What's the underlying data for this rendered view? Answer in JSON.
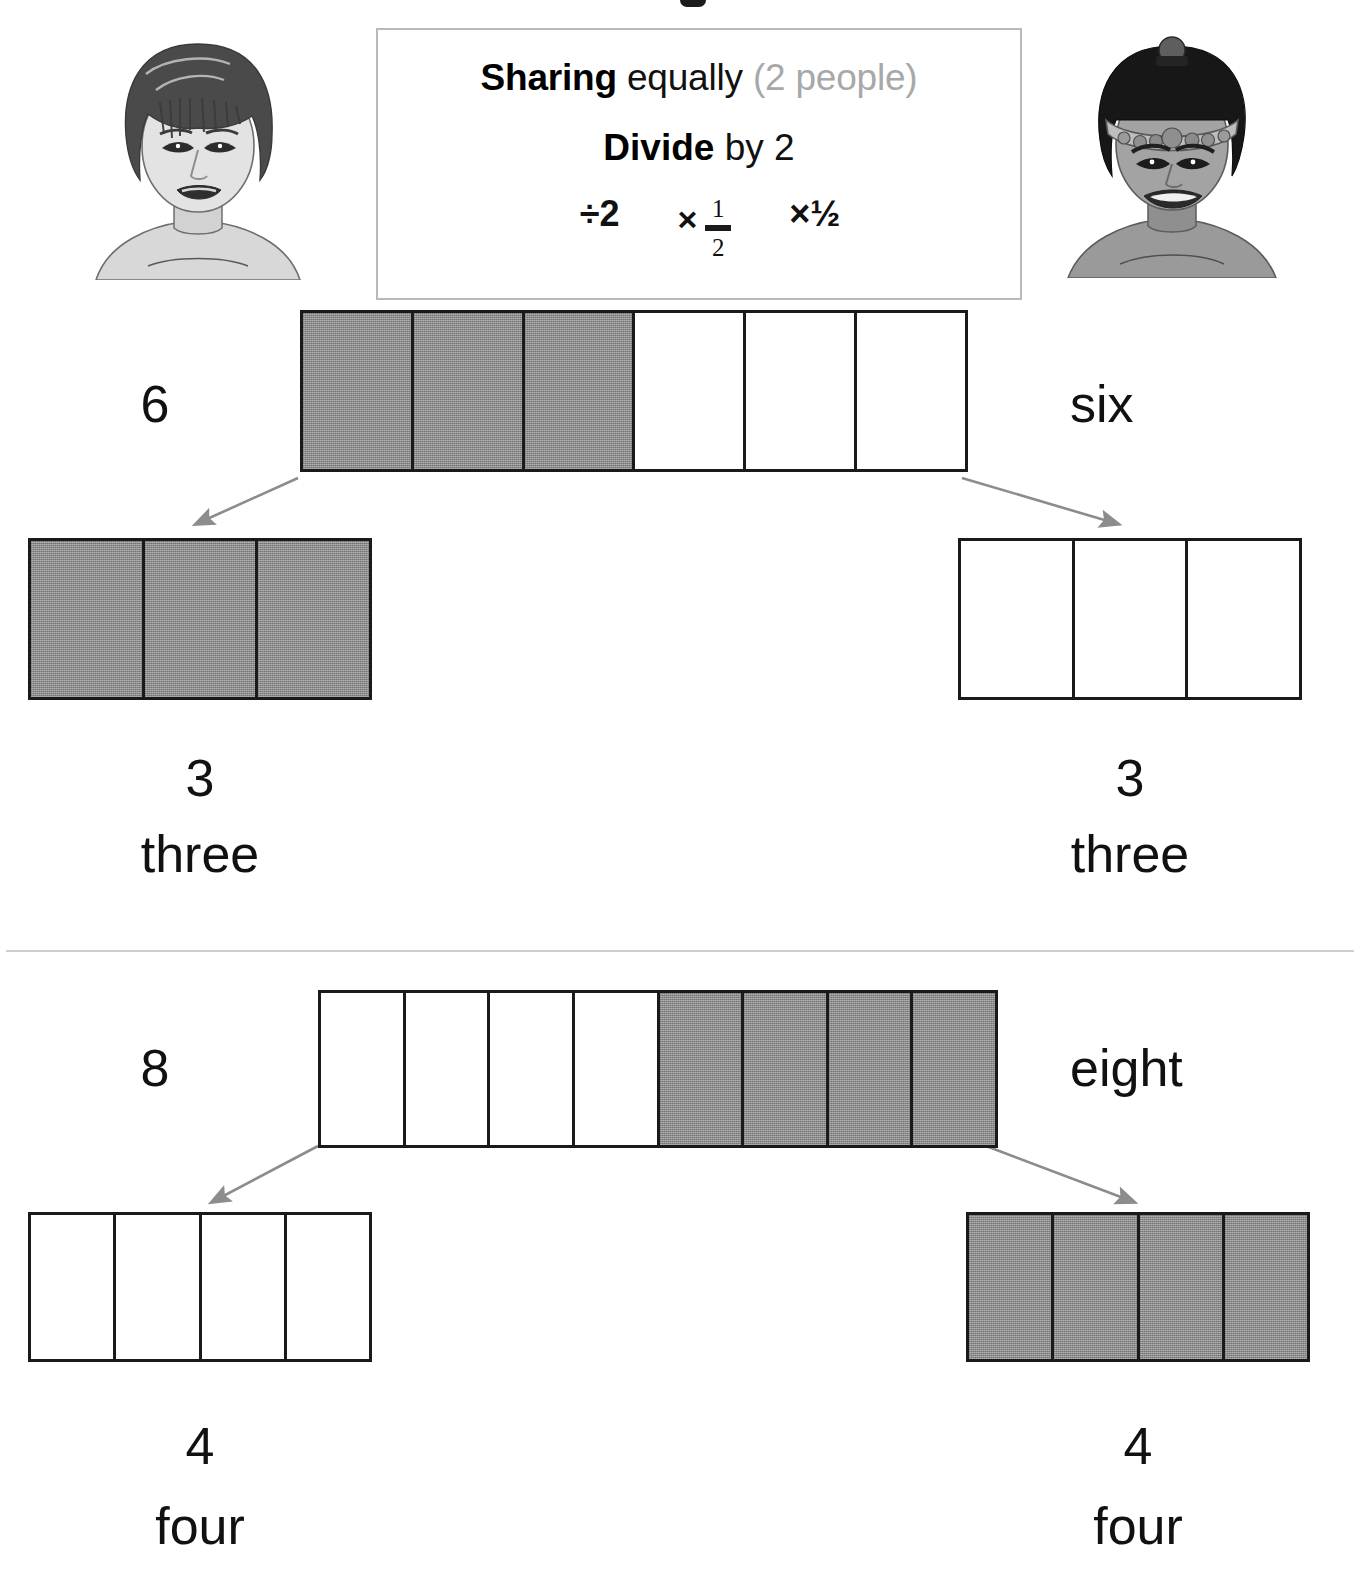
{
  "concept_box": {
    "line1": {
      "strong": "Sharing",
      "normal": " equally ",
      "muted": "(2 people)"
    },
    "line2": {
      "strong": "Divide",
      "normal": " by 2"
    },
    "notations": {
      "divide_by_two": "÷2",
      "times_fraction_symbol": "×",
      "times_fraction_numerator": "1",
      "times_fraction_denominator": "2",
      "times_half_slashed": "×½"
    }
  },
  "avatars": {
    "left": {
      "name": "person-short-dark-hair",
      "alt": "child with short dark hair"
    },
    "right": {
      "name": "person-beaded-headband",
      "alt": "child wearing a beaded headband"
    }
  },
  "sections": [
    {
      "id": "divide-six-by-two",
      "whole": {
        "digit": "6",
        "word": "six",
        "total_cells": 6,
        "shaded_cells": 3,
        "pattern": [
          "shaded",
          "shaded",
          "shaded",
          "empty",
          "empty",
          "empty"
        ]
      },
      "parts": [
        {
          "digit": "3",
          "word": "three",
          "total_cells": 3,
          "pattern": [
            "shaded",
            "shaded",
            "shaded"
          ]
        },
        {
          "digit": "3",
          "word": "three",
          "total_cells": 3,
          "pattern": [
            "empty",
            "empty",
            "empty"
          ]
        }
      ]
    },
    {
      "id": "divide-eight-by-two",
      "whole": {
        "digit": "8",
        "word": "eight",
        "total_cells": 8,
        "shaded_cells": 4,
        "pattern": [
          "empty",
          "empty",
          "empty",
          "empty",
          "shaded",
          "shaded",
          "shaded",
          "shaded"
        ]
      },
      "parts": [
        {
          "digit": "4",
          "word": "four",
          "total_cells": 4,
          "pattern": [
            "empty",
            "empty",
            "empty",
            "empty"
          ]
        },
        {
          "digit": "4",
          "word": "four",
          "total_cells": 4,
          "pattern": [
            "shaded",
            "shaded",
            "shaded",
            "shaded"
          ]
        }
      ]
    }
  ],
  "colors": {
    "shaded_fill": "#8a8a8a",
    "bar_outline": "#1a1a1a",
    "arrow": "#8c8c8c",
    "box_border": "#b9b9b9",
    "muted_text": "#a8a8a8",
    "divider": "#cfcfcf",
    "text": "#111111"
  }
}
